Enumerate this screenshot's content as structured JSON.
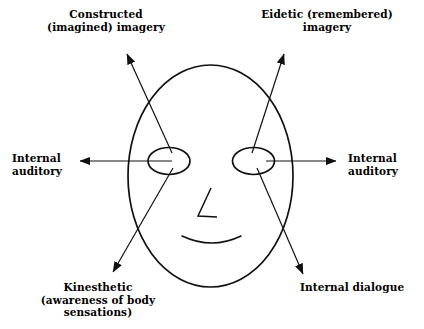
{
  "diagram": {
    "stroke_color": "#111111",
    "background_color": "#ffffff",
    "face": {
      "shape_name": "face-oval",
      "cx": 210.5,
      "cy": 176,
      "rx": 82.5,
      "ry": 111
    },
    "eye_left": {
      "shape_name": "left-eye-ellipse",
      "cx": 169,
      "cy": 161,
      "rx": 21,
      "ry": 13.5
    },
    "eye_right": {
      "shape_name": "right-eye-ellipse",
      "cx": 253.5,
      "cy": 161,
      "rx": 21,
      "ry": 13.5
    },
    "nose": {
      "shape_name": "nose-line",
      "points": "211,188 198,216 217,217"
    },
    "mouth": {
      "shape_name": "mouth-curve",
      "path": "M 182 236 Q 212 250 241 236"
    },
    "arrows": [
      {
        "id": "constructed-imagery-arrow",
        "label_key": "constructed",
        "x1": 172,
        "y1": 153,
        "x2": 127,
        "y2": 54,
        "direction": "up-left"
      },
      {
        "id": "eidetic-imagery-arrow",
        "label_key": "eidetic",
        "x1": 252,
        "y1": 153,
        "x2": 284,
        "y2": 54,
        "direction": "up-right"
      },
      {
        "id": "internal-auditory-left-arrow",
        "label_key": "internal_auditory_left",
        "x1": 172,
        "y1": 161,
        "x2": 80,
        "y2": 161,
        "direction": "left"
      },
      {
        "id": "internal-auditory-right-arrow",
        "label_key": "internal_auditory_right",
        "x1": 266,
        "y1": 161,
        "x2": 336,
        "y2": 161,
        "direction": "right"
      },
      {
        "id": "kinesthetic-arrow",
        "label_key": "kinesthetic",
        "x1": 173,
        "y1": 168,
        "x2": 113,
        "y2": 272,
        "direction": "down-left"
      },
      {
        "id": "internal-dialogue-arrow",
        "label_key": "internal_dialogue",
        "x1": 257,
        "y1": 168,
        "x2": 303,
        "y2": 274,
        "direction": "down-right"
      }
    ]
  },
  "labels": {
    "constructed": "Constructed\n(imagined) imagery",
    "eidetic": "Eidetic (remembered)\nimagery",
    "internal_auditory_left": "Internal\nauditory",
    "internal_auditory_right": "Internal\nauditory",
    "kinesthetic": "Kinesthetic\n(awareness of body\nsensations)",
    "internal_dialogue": "Internal dialogue"
  }
}
